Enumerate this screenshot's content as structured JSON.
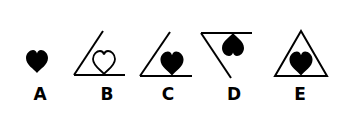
{
  "figure": {
    "type": "option-choice-diagram",
    "stroke_color": "#000000",
    "background": "#ffffff",
    "options": [
      {
        "label": "A",
        "description": "filled heart alone"
      },
      {
        "label": "B",
        "description": "outline heart inside angle, resting on horizontal line"
      },
      {
        "label": "C",
        "description": "filled heart inside angle, resting on horizontal line"
      },
      {
        "label": "D",
        "description": "inverted filled heart hanging from top line of inverted angle"
      },
      {
        "label": "E",
        "description": "filled heart inside triangle"
      }
    ]
  }
}
